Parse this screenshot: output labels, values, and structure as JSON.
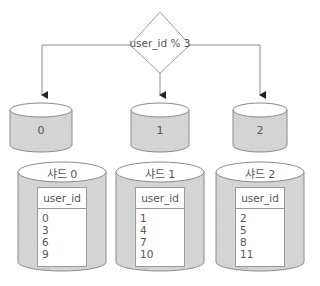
{
  "router": {
    "label": "user_id % 3"
  },
  "buckets": [
    {
      "label": "0"
    },
    {
      "label": "1"
    },
    {
      "label": "2"
    }
  ],
  "shards": [
    {
      "title": "샤드 0",
      "column": "user_id",
      "rows": [
        "0",
        "3",
        "6",
        "9",
        "..."
      ]
    },
    {
      "title": "샤드 1",
      "column": "user_id",
      "rows": [
        "1",
        "4",
        "7",
        "10",
        "..."
      ]
    },
    {
      "title": "샤드 2",
      "column": "user_id",
      "rows": [
        "2",
        "5",
        "8",
        "11",
        "..."
      ]
    }
  ],
  "colors": {
    "stroke": "#8a8a8a",
    "cylinder_fill": "#d9d9d9",
    "cylinder_top": "#ffffff"
  }
}
